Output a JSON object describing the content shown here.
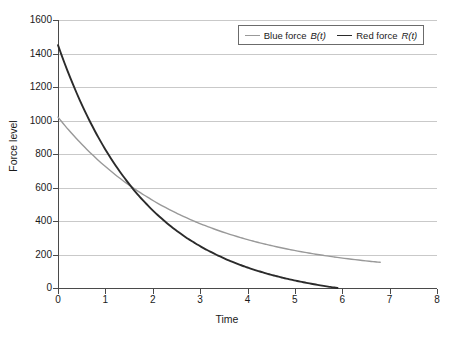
{
  "chart_data": {
    "type": "line",
    "title": "",
    "xlabel": "Time",
    "ylabel": "Force level",
    "xlim": [
      0,
      8
    ],
    "ylim": [
      0,
      1600
    ],
    "xticks": [
      0,
      1,
      2,
      3,
      4,
      5,
      6,
      7,
      8
    ],
    "yticks": [
      0,
      200,
      400,
      600,
      800,
      1000,
      1200,
      1400,
      1600
    ],
    "grid": "horizontal",
    "legend_position": "top-right",
    "series": [
      {
        "name": "Blue force B(t)",
        "label_prefix": "Blue force ",
        "label_fn": "B(t)",
        "color": "#999999",
        "x": [
          0,
          0.25,
          0.5,
          0.75,
          1,
          1.25,
          1.5,
          1.75,
          2,
          2.25,
          2.5,
          2.75,
          3,
          3.25,
          3.5,
          3.75,
          4,
          4.25,
          4.5,
          4.75,
          5,
          5.25,
          5.5,
          5.75,
          6,
          6.25,
          6.5,
          6.8
        ],
        "values": [
          1020,
          930,
          848,
          774,
          706,
          645,
          590,
          540,
          495,
          455,
          420,
          388,
          360,
          335,
          312,
          392,
          272,
          255,
          298,
          225,
          213,
          202,
          192,
          183,
          175,
          168,
          162,
          85
        ],
        "y_start": 1020,
        "y_end": 85,
        "x_end": 6.8
      },
      {
        "name": "Red force R(t)",
        "label_prefix": "Red force ",
        "label_fn": "R(t)",
        "color": "#2b2b2b",
        "x": [
          0,
          0.25,
          0.5,
          0.75,
          1,
          1.25,
          1.5,
          1.75,
          2,
          2.25,
          2.5,
          2.75,
          3,
          3.25,
          3.5,
          3.75,
          4,
          4.25,
          4.5,
          4.75,
          5,
          5.25,
          5.5,
          5.75,
          5.9
        ],
        "values": [
          1450,
          1300,
          1165,
          1045,
          935,
          838,
          750,
          670,
          600,
          535,
          478,
          425,
          378,
          335,
          296,
          260,
          228,
          196,
          166,
          137,
          109,
          82,
          55,
          22,
          0
        ],
        "y_start": 1450,
        "y_end": 0,
        "x_end": 5.9
      }
    ],
    "crossover": {
      "x": 4.4,
      "y": 120
    }
  },
  "axis": {
    "ylabel": "Force level",
    "xlabel": "Time",
    "ytick_labels": [
      "0",
      "200",
      "400",
      "600",
      "800",
      "1000",
      "1200",
      "1400",
      "1600"
    ],
    "xtick_labels": [
      "0",
      "1",
      "2",
      "3",
      "4",
      "5",
      "6",
      "7",
      "8"
    ]
  },
  "legend": {
    "items": [
      {
        "prefix": "Blue force ",
        "fn": "B(t)"
      },
      {
        "prefix": "Red force ",
        "fn": "R(t)"
      }
    ]
  },
  "colors": {
    "blue_force": "#999999",
    "red_force": "#2b2b2b",
    "gridline": "#c9c9c9",
    "axis": "#4a4a4a",
    "background": "#ffffff"
  }
}
